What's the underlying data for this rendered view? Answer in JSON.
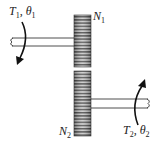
{
  "diagram": {
    "type": "gear-train",
    "gear1": {
      "label": "N1",
      "label_main": "N",
      "label_sub": "1"
    },
    "gear2": {
      "label": "N2",
      "label_main": "N",
      "label_sub": "2"
    },
    "input": {
      "label": "T1, θ1",
      "torque_main": "T",
      "torque_sub": "1",
      "sep": ", ",
      "angle_main": "θ",
      "angle_sub": "1"
    },
    "output": {
      "label": "T2, θ2",
      "torque_main": "T",
      "torque_sub": "2",
      "sep": ", ",
      "angle_main": "θ",
      "angle_sub": "2"
    },
    "colors": {
      "gear_dark": "#555555",
      "gear_light": "#bbbbbb",
      "line": "#222222"
    }
  }
}
